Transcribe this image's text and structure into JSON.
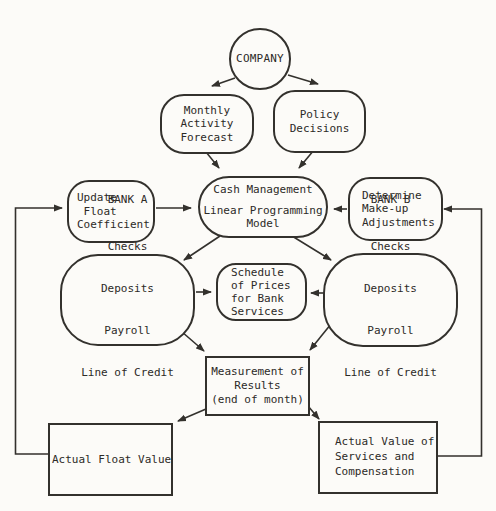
{
  "diagram": {
    "nodes": {
      "company": {
        "label": "COMPANY"
      },
      "monthly_activity_forecast": {
        "lines": [
          "Monthly",
          "Activity",
          "Forecast"
        ]
      },
      "policy_decisions": {
        "lines": [
          "Policy",
          "Decisions"
        ]
      },
      "update_float_coefficient": {
        "lines": [
          "Update",
          " Float",
          "Coefficient"
        ]
      },
      "cash_management_model": {
        "lines": [
          "Cash Management",
          "Linear Programming",
          "Model"
        ]
      },
      "determine_makeup_adjustments": {
        "lines": [
          "Determine",
          "Make-up",
          "Adjustments"
        ]
      },
      "bank_a": {
        "title": "BANK A",
        "services": [
          "Checks",
          "Deposits",
          "Payroll",
          "Line of Credit"
        ]
      },
      "bank_b": {
        "title": "BANK B",
        "services": [
          "Checks",
          "Deposits",
          "Payroll",
          "Line of Credit"
        ]
      },
      "schedule_of_prices": {
        "lines": [
          "Schedule",
          "of Prices",
          "for Bank",
          "Services"
        ]
      },
      "measurement_of_results": {
        "lines": [
          "Measurement of",
          "Results",
          "(end of month)"
        ]
      },
      "actual_float_value": {
        "label": "Actual Float Value"
      },
      "actual_value_of_services": {
        "lines": [
          "Actual Value of",
          "Services and",
          "Compensation"
        ]
      }
    },
    "colors": {
      "ink": "#2c2a27",
      "paper": "#fcfbf8"
    }
  }
}
